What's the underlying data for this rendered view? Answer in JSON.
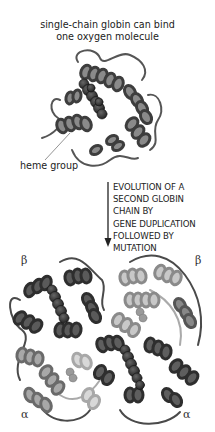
{
  "figure": {
    "top_caption_line1": "single-chain globin can bind",
    "top_caption_line2": "one oxygen molecule",
    "heme_label": "heme group",
    "process_lines": [
      "EVOLUTION OF A",
      "SECOND GLOBIN",
      "CHAIN BY",
      "GENE DUPLICATION",
      "FOLLOWED BY",
      "MUTATION"
    ],
    "subunit_labels": {
      "top_left": "β",
      "top_right": "β",
      "bottom_left": "α",
      "bottom_right": "α"
    },
    "colors": {
      "ribbon_dark": "#3a3a3a",
      "ribbon_mid": "#6e6e6e",
      "ribbon_light": "#b8b8b8",
      "heme": "#2a2a2a",
      "text": "#222222"
    }
  }
}
